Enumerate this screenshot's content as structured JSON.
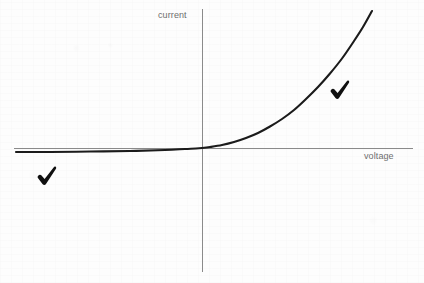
{
  "chart_data": {
    "type": "line",
    "title": "",
    "subtitle": "",
    "xlabel": "voltage",
    "ylabel": "current",
    "grid": false,
    "legend": null,
    "axis_style": "quadrant-cross",
    "xlim": [
      -1,
      1
    ],
    "ylim": [
      -1,
      1
    ],
    "axes": {
      "x_axis_y_value": 0,
      "y_axis_x_value": 0,
      "x_axis_color": "#8a8a8a",
      "y_axis_color": "#8a8a8a",
      "x_axis_pixels": {
        "x1": 14,
        "y1": 148,
        "x2": 413,
        "y2": 148
      },
      "y_axis_pixels": {
        "x1": 202,
        "y1": 9,
        "x2": 202,
        "y2": 272
      }
    },
    "series": [
      {
        "name": "diode I-V characteristic",
        "color": "#1b1b1b",
        "width_px": 2.1,
        "points_px": [
          [
            16,
            152
          ],
          [
            50,
            152
          ],
          [
            90,
            151.5
          ],
          [
            130,
            151
          ],
          [
            165,
            150
          ],
          [
            185,
            149
          ],
          [
            196,
            148.5
          ],
          [
            202,
            148
          ],
          [
            210,
            147
          ],
          [
            222,
            145
          ],
          [
            234,
            142
          ],
          [
            246,
            138
          ],
          [
            258,
            133
          ],
          [
            270,
            126.5
          ],
          [
            282,
            119
          ],
          [
            294,
            110
          ],
          [
            306,
            99
          ],
          [
            318,
            87
          ],
          [
            330,
            73.5
          ],
          [
            342,
            58.5
          ],
          [
            354,
            41
          ],
          [
            363,
            27
          ],
          [
            372,
            11
          ]
        ],
        "description": "Exponential forward-bias current with near-zero reverse current"
      }
    ],
    "annotations": [
      {
        "type": "checkmark",
        "name": "checkmark-forward-bias",
        "label": "✓",
        "color": "#101010",
        "x_px": 340,
        "y_px": 90,
        "size_px": 22,
        "quadrant": "upper-right"
      },
      {
        "type": "checkmark",
        "name": "checkmark-reverse-bias",
        "label": "✓",
        "color": "#101010",
        "x_px": 47,
        "y_px": 176,
        "size_px": 22,
        "quadrant": "lower-left"
      }
    ]
  },
  "figure": {
    "width": 424,
    "height": 283,
    "background_color": "#fdfdfd",
    "axis_label_color": "#6e6e6e",
    "curve_color": "#1b1b1b",
    "annotation_color": "#101010",
    "labels": {
      "y_axis": "current",
      "x_axis": "voltage"
    }
  }
}
